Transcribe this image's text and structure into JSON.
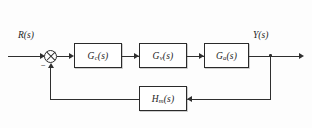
{
  "diagram": {
    "type": "control-system-block-diagram",
    "input_signal": {
      "base": "R",
      "arg": "(s)",
      "label": "R(s)"
    },
    "output_signal": {
      "base": "Y",
      "arg": "(s)",
      "label": "Y(s)"
    },
    "summing_junction": {
      "name": "summing-junction",
      "symbol": "crossed-circle",
      "input_sign_feedback": "−"
    },
    "blocks": [
      {
        "id": "controller",
        "base": "G",
        "sub": "c",
        "arg": "(s)",
        "label": "G_c(s)"
      },
      {
        "id": "actuator",
        "base": "G",
        "sub": "v",
        "arg": "(s)",
        "label": "G_v(s)"
      },
      {
        "id": "process",
        "base": "G",
        "sub": "a",
        "arg": "(s)",
        "label": "G_a(s)"
      },
      {
        "id": "sensor",
        "base": "H",
        "sub": "m",
        "arg": "(s)",
        "label": "H_m(s)"
      }
    ],
    "paths": {
      "forward": "R(s) → ⊗ → G_c(s) → G_v(s) → G_a(s) → Y(s)",
      "feedback": "Y(s) → H_m(s) → ⊗ (negative)"
    },
    "colors": {
      "line": "#2f2f2f",
      "block_border": "#2a2a2a",
      "text": "#1d1d1d",
      "background": "#fdfdfd"
    },
    "caption": ""
  }
}
